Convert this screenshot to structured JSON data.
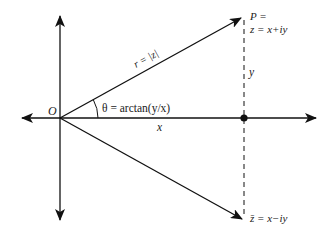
{
  "diagram": {
    "colors": {
      "background": "#ffffff",
      "stroke": "#111111",
      "text": "#222222"
    },
    "origin": {
      "label": "O",
      "x": 60,
      "y": 118
    },
    "axes": {
      "horizontal": {
        "left_tip": [
          22,
          118
        ],
        "right_tip": [
          316,
          118
        ]
      },
      "vertical": {
        "top_tip": [
          60,
          16
        ],
        "bottom_tip": [
          60,
          220
        ]
      }
    },
    "labels": {
      "origin": "O",
      "radius": "r = |z|",
      "angle": "θ = arctan(y/x)",
      "x_component": "x",
      "y_component": "y",
      "point_p_line1": "P =",
      "point_p_line2": "z = x+iy",
      "conjugate": "z̄ = x−iy"
    },
    "vectors": [
      {
        "name": "z",
        "from": [
          60,
          118
        ],
        "to": [
          241,
          18
        ]
      },
      {
        "name": "z-conjugate",
        "from": [
          60,
          118
        ],
        "to": [
          242,
          219
        ]
      }
    ],
    "projection": {
      "dashed_line_x": 244,
      "from_y": 18,
      "to_y": 219,
      "dot": [
        244,
        118
      ]
    }
  }
}
